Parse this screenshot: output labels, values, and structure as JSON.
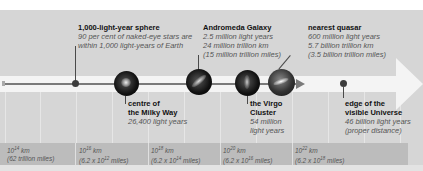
{
  "diagram": {
    "type": "logarithmic distance scale",
    "colors": {
      "panel": "#d6d6d6",
      "arrow": "#f4f4f4",
      "scale_band": "#bcbcbc",
      "axis": "#7a7a7a",
      "dot": "#3c3c3c"
    }
  },
  "markers": [
    {
      "id": "sphere",
      "title": "1,000-light-year sphere",
      "lines": [
        "90 per cent of naked-eye stars are",
        "within 1,000 light-years of Earth"
      ],
      "marker": "dot"
    },
    {
      "id": "milky-way",
      "title_lines": [
        "centre of",
        "the Milky Way"
      ],
      "lines": [
        "26,400 light years"
      ],
      "marker": "orb"
    },
    {
      "id": "andromeda",
      "title": "Andromeda Galaxy",
      "lines": [
        "2.5 million light years",
        "24 million trillion km",
        "(15 million trillion miles)"
      ],
      "marker": "orb"
    },
    {
      "id": "virgo",
      "title_lines": [
        "the Virgo",
        "Cluster"
      ],
      "lines": [
        "54 million",
        "light years"
      ],
      "marker": "orb"
    },
    {
      "id": "quasar",
      "title": "nearest quasar",
      "lines": [
        "600 million light years",
        "5.7 billion trillion km",
        "(3.5 billion trillion miles)"
      ],
      "marker": "orb"
    },
    {
      "id": "edge",
      "title_lines": [
        "edge of the",
        "visible Universe"
      ],
      "lines": [
        "46 billion light years",
        "(proper distance)"
      ],
      "marker": "dot"
    }
  ],
  "scale": [
    {
      "base": "10",
      "exp": "14",
      "unit": " km",
      "miles_pre": "(62 trillion miles)",
      "miles_exp": "",
      "miles_post": ""
    },
    {
      "base": "10",
      "exp": "16",
      "unit": " km",
      "miles_pre": "(6.2 x 10",
      "miles_exp": "12",
      "miles_post": " miles)"
    },
    {
      "base": "10",
      "exp": "18",
      "unit": " km",
      "miles_pre": "(6.2 x 10",
      "miles_exp": "14",
      "miles_post": " miles)"
    },
    {
      "base": "10",
      "exp": "20",
      "unit": " km",
      "miles_pre": "(6.2 x 10",
      "miles_exp": "16",
      "miles_post": " miles)"
    },
    {
      "base": "10",
      "exp": "22",
      "unit": " km",
      "miles_pre": "(6.2 x 10",
      "miles_exp": "18",
      "miles_post": " miles)"
    }
  ]
}
